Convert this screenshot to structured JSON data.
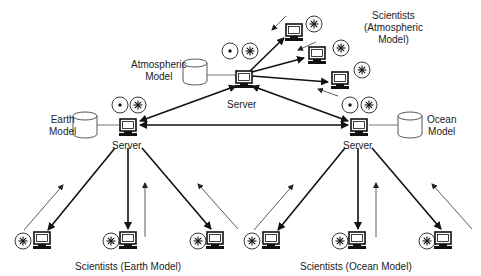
{
  "diagram": {
    "type": "distributed-model-network",
    "servers": [
      {
        "id": "atmospheric",
        "label": "Server",
        "model": "Atmospheric Model"
      },
      {
        "id": "earth",
        "label": "Server",
        "model": "Earth Model"
      },
      {
        "id": "ocean",
        "label": "Server",
        "model": "Ocean Model"
      }
    ],
    "labels": {
      "atmospheric_model_line1": "Atmospheric",
      "atmospheric_model_line2": "Model",
      "earth_model_line1": "Earth",
      "earth_model_line2": "Model",
      "ocean_model_line1": "Ocean",
      "ocean_model_line2": "Model",
      "server_atmospheric": "Server",
      "server_earth": "Server",
      "server_ocean": "Server",
      "scientists_atmospheric_line1": "Scientists",
      "scientists_atmospheric_line2": "(Atmospheric",
      "scientists_atmospheric_line3": "Model)",
      "scientists_earth": "Scientists (Earth Model)",
      "scientists_ocean": "Scientists (Ocean Model)"
    },
    "icons": {
      "computer": "computer-icon",
      "database": "cylinder-database-icon",
      "dot_circle": "dot-circle-icon",
      "star_circle": "asterisk-circle-icon"
    },
    "colors": {
      "line": "#111111",
      "background": "#ffffff",
      "text": "#222222"
    }
  }
}
